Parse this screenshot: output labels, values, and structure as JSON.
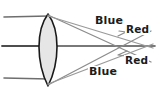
{
  "figure": {
    "background_color": "#ffffff",
    "width": 157,
    "height": 90
  },
  "lens": {
    "name": "biconvex-converging-lens",
    "fill_color": "#e6e6e6",
    "outline_color": "#1a1a1a",
    "center_x": 48,
    "top_y": 14,
    "bottom_y": 86,
    "half_width": 13
  },
  "optical_axis": {
    "label": "optical-axis",
    "y": 46,
    "color": "#4d4d4d"
  },
  "incident_rays": [
    {
      "name": "incident-ray-top",
      "y": 17,
      "x_start": 4,
      "x_end": 48
    },
    {
      "name": "incident-ray-middle",
      "y": 46,
      "x_start": 2,
      "x_end": 48
    },
    {
      "name": "incident-ray-bottom",
      "y": 78,
      "x_start": 4,
      "x_end": 48
    }
  ],
  "refracted_rays": [
    {
      "name": "blue-ray-from-top",
      "color_label": "Blue",
      "color": "#8c8c8c",
      "from_x": 48,
      "from_y": 15,
      "to_x": 151,
      "to_y": 62
    },
    {
      "name": "red-ray-from-top",
      "color_label": "Red",
      "color": "#9a9a9a",
      "from_x": 48,
      "from_y": 16,
      "to_x": 153,
      "to_y": 48
    },
    {
      "name": "blue-ray-from-bottom",
      "color_label": "Blue",
      "color": "#8c8c8c",
      "from_x": 48,
      "from_y": 85,
      "to_x": 151,
      "to_y": 31
    },
    {
      "name": "red-ray-from-bottom",
      "color_label": "Red",
      "color": "#9a9a9a",
      "from_x": 48,
      "from_y": 84,
      "to_x": 153,
      "to_y": 44
    }
  ],
  "labels": {
    "blue_top": "Blue",
    "red_top": "Red",
    "red_bottom": "Red",
    "blue_bottom": "Blue"
  },
  "arrowheads": [
    {
      "name": "arrowhead-red-upper",
      "x": 123,
      "y": 34,
      "angle": -18
    },
    {
      "name": "arrowhead-red-lower",
      "x": 122,
      "y": 53,
      "angle": 198
    }
  ]
}
